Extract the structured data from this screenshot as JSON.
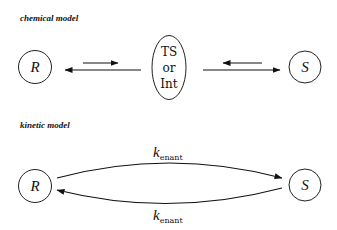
{
  "chemical_model": {
    "title": "chemical model",
    "nodes": {
      "left": "R",
      "middle": [
        "TS",
        "or",
        "Int"
      ],
      "right": "S"
    },
    "arrows": [
      {
        "from": "R",
        "to": "TS or Int",
        "type": "equilibrium"
      },
      {
        "from": "TS or Int",
        "to": "S",
        "type": "equilibrium"
      }
    ]
  },
  "kinetic_model": {
    "title": "kinetic model",
    "nodes": {
      "left": "R",
      "right": "S"
    },
    "rates": {
      "forward": {
        "symbol": "k",
        "subscript": "enant"
      },
      "reverse": {
        "symbol": "k",
        "subscript": "enant"
      }
    }
  },
  "colors": {
    "ink": "#111111",
    "background": "#ffffff"
  }
}
